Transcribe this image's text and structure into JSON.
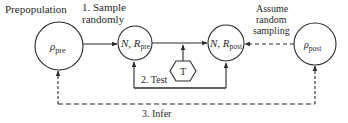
{
  "diagram": {
    "labels": {
      "prepopulation": "Prepopulation",
      "step1_line1": "1. Sample",
      "step1_line2": "randomly",
      "step2": "2. Test",
      "step3": "3. Infer",
      "assume_line1": "Assume",
      "assume_line2": "random",
      "assume_line3": "sampling"
    },
    "nodes": [
      {
        "id": "rho_pre",
        "symbol": "ρ",
        "subscript": "pre"
      },
      {
        "id": "N_R_pre",
        "symbol": "N, R",
        "subscript": "pre"
      },
      {
        "id": "N_R_post",
        "symbol": "N, R",
        "subscript": "post"
      },
      {
        "id": "rho_post",
        "symbol": "ρ",
        "subscript": "post"
      }
    ],
    "test_node": {
      "label": "T"
    },
    "colors": {
      "stroke": "#2a2a2a",
      "background": "#ffffff"
    }
  }
}
